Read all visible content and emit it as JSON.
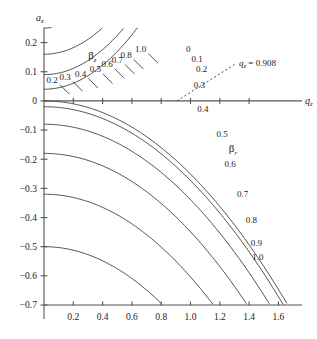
{
  "figure": {
    "background_color": "#ffffff",
    "axis_color": "#555555",
    "curve_color": "#333333"
  },
  "axes": {
    "x_label": "q",
    "x_label_sub": "z",
    "y_label": "a",
    "y_label_sub": "z",
    "x_ticks": [
      0.2,
      0.4,
      0.6,
      0.8,
      1.0,
      1.2,
      1.4,
      1.6
    ],
    "x_tick_labels": [
      "0.2",
      "0.4",
      "0.6",
      "0.8",
      "1.0",
      "1.2",
      "1.4",
      "1.6"
    ],
    "y_ticks": [
      0.2,
      0.1,
      0,
      -0.1,
      -0.2,
      -0.3,
      -0.4,
      -0.5,
      -0.6,
      -0.7
    ],
    "y_tick_labels": [
      "0.2",
      "0.1",
      "0",
      "−0.1",
      "−0.2",
      "−0.3",
      "−0.4",
      "−0.5",
      "−0.6",
      "−0.7"
    ],
    "xlim": [
      0.0,
      1.72
    ],
    "ylim": [
      -0.7,
      0.25
    ]
  },
  "families": {
    "beta_z": {
      "symbol": "β",
      "subscript": "z",
      "label_x": 0.33,
      "label_y": 0.142,
      "values": [
        0.2,
        0.3,
        0.4,
        0.5,
        0.6,
        0.7,
        0.8,
        0.9,
        1.0
      ],
      "labeled_values": [
        0.2,
        0.3,
        0.4,
        0.5,
        0.6,
        0.7,
        0.8,
        1.0
      ],
      "labels": [
        "0.2",
        "0.3",
        "0.4",
        "0.5",
        "0.6",
        "0.7",
        "0.8",
        "1.0"
      ]
    },
    "beta_r": {
      "symbol": "β",
      "subscript": "r",
      "label_x": 1.29,
      "label_y": -0.175,
      "values": [
        0.0,
        0.1,
        0.2,
        0.3,
        0.4,
        0.5,
        0.6,
        0.7,
        0.8,
        0.9,
        1.0
      ],
      "labeled_values": [
        0.0,
        0.1,
        0.2,
        0.3,
        0.4,
        0.5,
        0.6,
        0.7,
        0.8,
        0.9,
        1.0
      ],
      "labels": [
        "0",
        "0.1",
        "0.2",
        "0.3",
        "0.4",
        "0.5",
        "0.6",
        "0.7",
        "0.8",
        "0.9",
        "1.0"
      ]
    }
  },
  "annotation": {
    "text": "q",
    "text_sub": "z",
    "text_rest": " = 0.908",
    "value": 0.908,
    "line_from_x": 0.908,
    "line_from_y": 0.0,
    "line_to_x": 1.31,
    "line_to_y": 0.128
  },
  "chart_data": {
    "type": "line",
    "xlabel": "q_z",
    "ylabel": "a_z",
    "xlim": [
      0.0,
      1.72
    ],
    "ylim": [
      -0.7,
      0.25
    ],
    "grid": false,
    "legend": "inline curve labels",
    "annotations": [
      {
        "text": "q_z = 0.908",
        "x": 1.31,
        "y": 0.128,
        "note": "Mathieu q-value at the stability boundary for a_z = 0"
      }
    ],
    "series": [
      {
        "name": "beta_z = 0.2",
        "family": "beta_z",
        "beta": 0.2,
        "x": [
          0.0,
          0.1,
          0.2,
          0.3,
          0.4,
          0.5,
          0.6,
          0.7,
          0.8,
          0.87
        ],
        "y": [
          0.0198,
          0.0191,
          0.017,
          0.0134,
          0.0083,
          0.0016,
          -0.0067,
          -0.0167,
          -0.0284,
          -0.0376
        ]
      },
      {
        "name": "beta_z = 0.3",
        "family": "beta_z",
        "beta": 0.3,
        "x": [
          0.0,
          0.12,
          0.24,
          0.36,
          0.48,
          0.6,
          0.72,
          0.84,
          0.96,
          1.02
        ],
        "y": [
          0.045,
          0.0438,
          0.0402,
          0.0341,
          0.0255,
          0.0144,
          0.0008,
          -0.0154,
          -0.0341,
          -0.0444
        ]
      },
      {
        "name": "beta_z = 0.4",
        "family": "beta_z",
        "beta": 0.4,
        "x": [
          0.0,
          0.14,
          0.28,
          0.42,
          0.56,
          0.7,
          0.84,
          0.98,
          1.12,
          1.2
        ],
        "y": [
          0.08,
          0.0779,
          0.0717,
          0.0613,
          0.0466,
          0.0277,
          0.0045,
          -0.0229,
          -0.0547,
          -0.074
        ]
      },
      {
        "name": "beta_z = 0.5",
        "family": "beta_z",
        "beta": 0.5,
        "x": [
          0.0,
          0.16,
          0.32,
          0.48,
          0.64,
          0.8,
          0.96,
          1.12,
          1.28,
          1.36
        ],
        "y": [
          0.125,
          0.1218,
          0.1122,
          0.096,
          0.0733,
          0.044,
          0.008,
          -0.0346,
          -0.084,
          -0.1112
        ]
      },
      {
        "name": "beta_z = 0.6",
        "family": "beta_z",
        "beta": 0.6,
        "x": [
          0.0,
          0.18,
          0.36,
          0.54,
          0.72,
          0.9,
          1.08,
          1.26,
          1.4
        ],
        "y": [
          0.18,
          0.1757,
          0.1626,
          0.1407,
          0.1099,
          0.0701,
          0.0214,
          -0.0363,
          -0.0893
        ]
      },
      {
        "name": "beta_z = 0.7",
        "family": "beta_z",
        "beta": 0.7,
        "x": [
          0.0,
          0.2,
          0.4,
          0.6,
          0.8,
          1.0,
          1.2,
          1.38
        ],
        "y": [
          0.245,
          0.2396,
          0.2236,
          0.1966,
          0.1585,
          0.1093,
          0.0489,
          -0.015
        ]
      },
      {
        "name": "beta_z = 0.8",
        "family": "beta_z",
        "beta": 0.8,
        "x": [
          0.0,
          0.22,
          0.44,
          0.66,
          0.88,
          1.1,
          1.32
        ],
        "y": [
          0.32,
          0.3136,
          0.2944,
          0.2622,
          0.2168,
          0.1582,
          0.0862
        ]
      },
      {
        "name": "beta_z = 0.9",
        "family": "beta_z",
        "beta": 0.9,
        "x": [
          0.0,
          0.24,
          0.48,
          0.72,
          0.96,
          1.2
        ],
        "y": [
          0.405,
          0.3976,
          0.3754,
          0.3382,
          0.2857,
          0.2177
        ]
      },
      {
        "name": "beta_z = 1.0",
        "family": "beta_z",
        "beta": 1.0,
        "x": [
          0.0,
          0.2,
          0.4,
          0.6,
          0.8,
          1.0,
          1.2
        ],
        "y": [
          0.5,
          0.49,
          0.46,
          0.41,
          0.34,
          0.25,
          0.14
        ]
      },
      {
        "name": "beta_r = 0",
        "family": "beta_r",
        "beta": 0.0,
        "x": [
          0.0,
          0.2,
          0.4,
          0.6,
          0.8,
          0.908
        ],
        "y": [
          0.0,
          -0.01,
          -0.0401,
          -0.0907,
          -0.1625,
          -0.209
        ]
      },
      {
        "name": "beta_r = 0.1",
        "family": "beta_r",
        "beta": 0.1,
        "x": [
          0.0,
          0.2,
          0.4,
          0.6,
          0.8,
          1.0
        ],
        "y": [
          -0.005,
          -0.015,
          -0.0452,
          -0.096,
          -0.1682,
          -0.263
        ]
      },
      {
        "name": "beta_r = 0.2",
        "family": "beta_r",
        "beta": 0.2,
        "x": [
          0.0,
          0.2,
          0.4,
          0.6,
          0.8,
          1.0
        ],
        "y": [
          -0.0198,
          -0.03,
          -0.0604,
          -0.1117,
          -0.1849,
          -0.2813
        ]
      },
      {
        "name": "beta_r = 0.3",
        "family": "beta_r",
        "beta": 0.3,
        "x": [
          0.0,
          0.2,
          0.4,
          0.6,
          0.8,
          1.0,
          1.1
        ],
        "y": [
          -0.045,
          -0.0552,
          -0.086,
          -0.138,
          -0.2128,
          -0.312,
          -0.372
        ]
      },
      {
        "name": "beta_r = 0.4",
        "family": "beta_r",
        "beta": 0.4,
        "x": [
          0.0,
          0.2,
          0.4,
          0.6,
          0.8,
          1.0,
          1.15
        ],
        "y": [
          -0.08,
          -0.0904,
          -0.1218,
          -0.175,
          -0.2519,
          -0.3546,
          -0.442
        ]
      },
      {
        "name": "beta_r = 0.5",
        "family": "beta_r",
        "beta": 0.5,
        "x": [
          0.0,
          0.2,
          0.4,
          0.6,
          0.8,
          1.0,
          1.18
        ],
        "y": [
          -0.125,
          -0.1356,
          -0.168,
          -0.2232,
          -0.3036,
          -0.412,
          -0.526
        ]
      },
      {
        "name": "beta_r = 0.6",
        "family": "beta_r",
        "beta": 0.6,
        "x": [
          0.0,
          0.2,
          0.4,
          0.6,
          0.8,
          1.0,
          1.2
        ],
        "y": [
          -0.18,
          -0.1908,
          -0.224,
          -0.2812,
          -0.3652,
          -0.48,
          -0.611
        ]
      },
      {
        "name": "beta_r = 0.7",
        "family": "beta_r",
        "beta": 0.7,
        "x": [
          0.0,
          0.2,
          0.4,
          0.6,
          0.8,
          1.0,
          1.21
        ],
        "y": [
          -0.245,
          -0.256,
          -0.2899,
          -0.3489,
          -0.4364,
          -0.5572,
          -0.688
        ]
      },
      {
        "name": "beta_r = 0.8",
        "family": "beta_r",
        "beta": 0.8,
        "x": [
          0.0,
          0.2,
          0.4,
          0.6,
          0.8,
          1.0,
          1.22
        ],
        "y": [
          -0.32,
          -0.3312,
          -0.3658,
          -0.4263,
          -0.5168,
          -0.6432,
          -0.7
        ]
      },
      {
        "name": "beta_r = 0.9",
        "family": "beta_r",
        "beta": 0.9,
        "x": [
          0.0,
          0.2,
          0.4,
          0.6,
          0.8,
          1.0,
          1.22
        ],
        "y": [
          -0.405,
          -0.4163,
          -0.4514,
          -0.5132,
          -0.6062,
          -0.7,
          -0.7
        ]
      },
      {
        "name": "beta_r = 1.0",
        "family": "beta_r",
        "beta": 1.0,
        "x": [
          0.0,
          0.2,
          0.4,
          0.6,
          0.8,
          1.0,
          1.23
        ],
        "y": [
          -0.5,
          -0.51,
          -0.54,
          -0.59,
          -0.66,
          -0.7,
          -0.7
        ]
      }
    ]
  }
}
